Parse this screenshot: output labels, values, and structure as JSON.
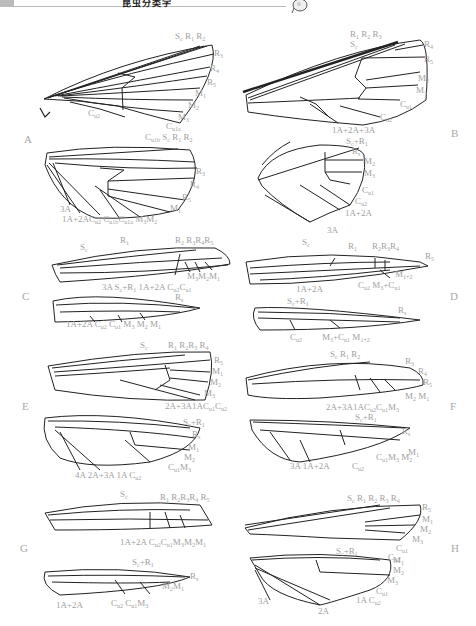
{
  "header": {
    "title": "昆虫分类学",
    "logo": "insect-logo-icon"
  },
  "figure": {
    "panels": [
      {
        "id": "A",
        "labels_forewing": [
          "Sc",
          "R1",
          "R2",
          "R3",
          "R4",
          "R5",
          "M1",
          "M2",
          "M3",
          "Cu1a",
          "Cu1b",
          "Cu2"
        ],
        "labels_hindwing": [
          "Sc",
          "R1",
          "R2",
          "R3",
          "R4",
          "R5",
          "M1",
          "M2",
          "M3",
          "Cu1a",
          "Cu1b",
          "Cu2",
          "1A+2A",
          "3A"
        ]
      },
      {
        "id": "B",
        "labels_forewing": [
          "Sc",
          "R1",
          "R2",
          "R3",
          "R4",
          "R5",
          "M2",
          "M3",
          "Cu1",
          "Cu2",
          "1A+2A+3A"
        ],
        "labels_hindwing": [
          "Sc+R1",
          "Rs",
          "M2",
          "M3",
          "Cu1",
          "Cu2",
          "1A+2A",
          "3A"
        ]
      },
      {
        "id": "C",
        "labels_forewing": [
          "Sc",
          "R1",
          "R2",
          "R3",
          "R4",
          "R5",
          "M3",
          "M2",
          "M1",
          "Cu2",
          "Cu1",
          "3A",
          "1A+2A"
        ],
        "labels_hindwing": [
          "Sc+R1",
          "Rs",
          "1A+2A",
          "Cu2",
          "Cu1",
          "M3",
          "M2",
          "M1"
        ]
      },
      {
        "id": "D",
        "labels_forewing": [
          "Sc",
          "R1",
          "R2",
          "R3",
          "R4",
          "R5",
          "M1+2",
          "M3+Cu1",
          "Cu2",
          "1A+2A"
        ],
        "labels_hindwing": [
          "Sc+R1",
          "Rs",
          "Cu2",
          "M3+Cu1",
          "M1+2"
        ]
      },
      {
        "id": "E",
        "labels_forewing": [
          "Sc",
          "R1",
          "R2",
          "R3",
          "R4",
          "R5",
          "M1",
          "M2",
          "M3",
          "Cu1",
          "Cu2",
          "1A",
          "2A+3A"
        ],
        "labels_hindwing": [
          "Sc+R1",
          "Rs",
          "M1",
          "M2",
          "M3",
          "Cu1",
          "Cu2",
          "1A",
          "2A+3A",
          "4A"
        ]
      },
      {
        "id": "F",
        "labels_forewing": [
          "Sc",
          "R1",
          "R2",
          "R3",
          "R4",
          "R5",
          "M1",
          "M2",
          "M3",
          "Cu1",
          "Cu2",
          "1A",
          "2A+3A"
        ],
        "labels_hindwing": [
          "Sc+R1",
          "Rs",
          "M1",
          "M2",
          "M3",
          "Cu1",
          "Cu2",
          "1A+2A",
          "3A"
        ]
      },
      {
        "id": "G",
        "labels_forewing": [
          "Sc",
          "R1",
          "R2",
          "R3",
          "R4",
          "R5",
          "M1",
          "M2",
          "M3",
          "Cu1",
          "Cu2",
          "1A+2A"
        ],
        "labels_hindwing": [
          "Sc+R1",
          "Rs",
          "M1",
          "M2",
          "M3",
          "Cu1",
          "Cu2",
          "1A+2A"
        ]
      },
      {
        "id": "H",
        "labels_forewing": [
          "Sc",
          "R1",
          "R2",
          "R3",
          "R4",
          "R5",
          "M1",
          "M2",
          "M3",
          "Cu1",
          "Cu2"
        ],
        "labels_hindwing": [
          "Sc+R1",
          "M1",
          "M2",
          "M3",
          "Cu1",
          "Cu2",
          "1A",
          "2A",
          "3A"
        ]
      }
    ]
  },
  "panel_letters": {
    "A": "A",
    "B": "B",
    "C": "C",
    "D": "D",
    "E": "E",
    "F": "F",
    "G": "G",
    "H": "H"
  }
}
